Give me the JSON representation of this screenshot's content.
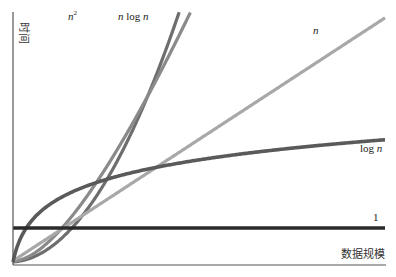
{
  "chart_data": {
    "type": "line",
    "title": "",
    "xlabel": "数据规模",
    "ylabel": "时间",
    "grid": false,
    "legend": "inline-labels",
    "xlim": [
      0,
      10
    ],
    "ylim": [
      0,
      10
    ],
    "series": [
      {
        "name": "n²",
        "label_base": "n",
        "label_sup": "2",
        "func": "n2",
        "color": "#6e6e6e"
      },
      {
        "name": "n log n",
        "label_parts": [
          "n",
          " log ",
          "n"
        ],
        "func": "nlogn",
        "color": "#8a8a8a"
      },
      {
        "name": "n",
        "label_parts": [
          "n"
        ],
        "func": "n",
        "color": "#a8a8a8"
      },
      {
        "name": "log n",
        "label_parts": [
          "log ",
          "n"
        ],
        "func": "logn",
        "color": "#5a5a5a"
      },
      {
        "name": "1",
        "label_parts": [
          "1"
        ],
        "func": "const",
        "color": "#2a2a2a"
      }
    ]
  }
}
